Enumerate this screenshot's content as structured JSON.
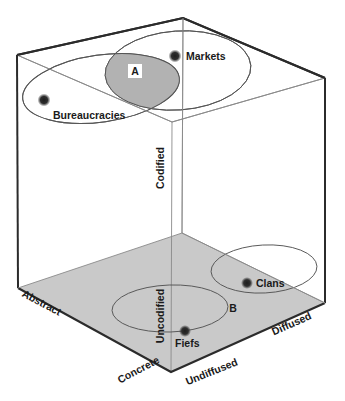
{
  "figure": {
    "type": "diagram",
    "subtype": "3d-cube-conceptual-space",
    "colors": {
      "stroke": "#2b2b2b",
      "thin_stroke": "#6e6e6e",
      "floor_fill": "#c9c9c9",
      "overlap_fill": "#b0b0b0",
      "dot": "#2a2a2a",
      "background": "#ffffff"
    }
  },
  "axes": [
    {
      "id": "codified",
      "label": "Codified"
    },
    {
      "id": "uncodified",
      "label": "Uncodified"
    },
    {
      "id": "abstract",
      "label": "Abstract"
    },
    {
      "id": "concrete",
      "label": "Concrete"
    },
    {
      "id": "diffused",
      "label": "Diffused"
    },
    {
      "id": "undiffused",
      "label": "Undiffused"
    }
  ],
  "items": [
    {
      "id": "markets",
      "label": "Markets",
      "plane": "top"
    },
    {
      "id": "bureaucracies",
      "label": "Bureaucracies",
      "plane": "top"
    },
    {
      "id": "clans",
      "label": "Clans",
      "plane": "bottom"
    },
    {
      "id": "fiefs",
      "label": "Fiefs",
      "plane": "bottom"
    }
  ],
  "regions": [
    {
      "id": "region-a",
      "label": "A",
      "plane": "top",
      "shaded": true
    },
    {
      "id": "region-b",
      "label": "B",
      "plane": "bottom",
      "shaded": false
    }
  ]
}
